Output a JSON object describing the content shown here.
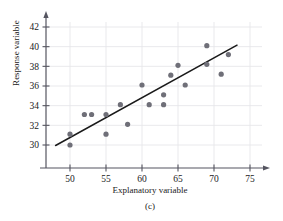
{
  "figure": {
    "caption": "(c)",
    "xlabel": "Explanatory variable",
    "ylabel": "Response variable"
  },
  "colors": {
    "point": "#6f6f78",
    "line": "#1a1a1a",
    "axis": "#555560",
    "grid": "#e6e6ea",
    "text": "#1a1a1a"
  },
  "chart_data": {
    "type": "scatter",
    "title": "",
    "subtitle": "(c)",
    "xlabel": "Explanatory variable",
    "ylabel": "Response variable",
    "xlim": [
      46,
      76
    ],
    "ylim": [
      28.8,
      43.2
    ],
    "xticks": [
      50,
      55,
      60,
      65,
      70,
      75
    ],
    "yticks": [
      30,
      32,
      34,
      36,
      38,
      40,
      42
    ],
    "xtick_labels": [
      "50",
      "55",
      "60",
      "65",
      "70",
      "75"
    ],
    "ytick_labels": [
      "30",
      "32",
      "34",
      "36",
      "38",
      "40",
      "42"
    ],
    "grid": true,
    "legend": null,
    "points": [
      {
        "x": 50,
        "y": 30.0
      },
      {
        "x": 50,
        "y": 31.1
      },
      {
        "x": 52,
        "y": 33.1
      },
      {
        "x": 53,
        "y": 33.1
      },
      {
        "x": 55,
        "y": 31.1
      },
      {
        "x": 55,
        "y": 33.1
      },
      {
        "x": 57,
        "y": 34.1
      },
      {
        "x": 58,
        "y": 32.1
      },
      {
        "x": 60,
        "y": 36.1
      },
      {
        "x": 61,
        "y": 34.1
      },
      {
        "x": 63,
        "y": 34.1
      },
      {
        "x": 63,
        "y": 35.1
      },
      {
        "x": 64,
        "y": 37.1
      },
      {
        "x": 65,
        "y": 38.1
      },
      {
        "x": 66,
        "y": 36.1
      },
      {
        "x": 69,
        "y": 38.2
      },
      {
        "x": 69,
        "y": 40.1
      },
      {
        "x": 71,
        "y": 37.2
      },
      {
        "x": 72,
        "y": 39.2
      }
    ],
    "trendline": {
      "type": "line",
      "x": [
        48.0,
        73.2
      ],
      "y": [
        29.95,
        40.15
      ]
    }
  }
}
